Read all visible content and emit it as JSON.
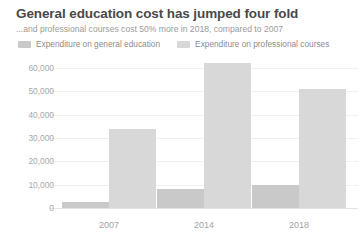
{
  "header": {
    "title": "General education cost has jumped four fold",
    "subtitle": "...and professional courses cost 50% more in 2018, compared to 2007"
  },
  "legend": {
    "position": "top-left",
    "items": [
      {
        "label": "Expenditure on general education",
        "color": "#c9c9c9"
      },
      {
        "label": "Expenditure on professional courses",
        "color": "#d8d8d8"
      }
    ]
  },
  "colors": {
    "title": "#4a4a4a",
    "subtitle": "#9b9b9b",
    "axis_label": "#a8a8a8",
    "gridline": "#f0f0f0",
    "baseline": "#e4e4e4",
    "series_general": "#c9c9c9",
    "series_professional": "#d8d8d8",
    "background": "#ffffff"
  },
  "chart_data": {
    "type": "bar",
    "title": "General education cost has jumped four fold",
    "subtitle": "...and professional courses cost 50% more in 2018, compared to 2007",
    "xlabel": "",
    "ylabel": "",
    "categories": [
      "2007",
      "2014",
      "2018"
    ],
    "series": [
      {
        "name": "Expenditure on general education",
        "color": "#c9c9c9",
        "values": [
          2500,
          8200,
          10000
        ]
      },
      {
        "name": "Expenditure on professional courses",
        "color": "#d8d8d8",
        "values": [
          34000,
          62000,
          51000
        ]
      }
    ],
    "ylim": [
      0,
      60000
    ],
    "yticks": [
      0,
      10000,
      20000,
      30000,
      40000,
      50000,
      60000
    ],
    "ytick_labels": [
      "0",
      "10,000",
      "20,000",
      "30,000",
      "40,000",
      "50,000",
      "60,000"
    ],
    "grid": true,
    "grid_axis": "y",
    "legend_position": "top-left"
  }
}
